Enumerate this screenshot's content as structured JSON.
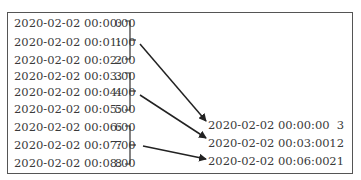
{
  "caption_fragment": "·· ·· ······ ·······",
  "input_series": [
    {
      "timestamp": "2020-02-02 00:00:00",
      "value": "0"
    },
    {
      "timestamp": "2020-02-02 00:01:00",
      "value": "1"
    },
    {
      "timestamp": "2020-02-02 00:02:00",
      "value": "2"
    },
    {
      "timestamp": "2020-02-02 00:03:00",
      "value": "3"
    },
    {
      "timestamp": "2020-02-02 00:04:00",
      "value": "4"
    },
    {
      "timestamp": "2020-02-02 00:05:00",
      "value": "5"
    },
    {
      "timestamp": "2020-02-02 00:06:00",
      "value": "6"
    },
    {
      "timestamp": "2020-02-02 00:07:00",
      "value": "7"
    },
    {
      "timestamp": "2020-02-02 00:08:00",
      "value": "8"
    }
  ],
  "resampled_series": [
    {
      "timestamp": "2020-02-02 00:00:00",
      "value": "3"
    },
    {
      "timestamp": "2020-02-02 00:03:00",
      "value": "12"
    },
    {
      "timestamp": "2020-02-02 00:06:00",
      "value": "21"
    }
  ],
  "colors": {
    "text": "#3a3a3a",
    "border": "#555555",
    "arrow": "#222222"
  }
}
